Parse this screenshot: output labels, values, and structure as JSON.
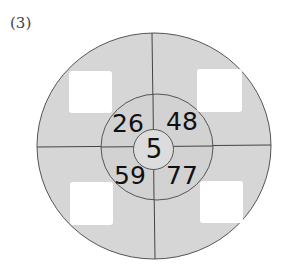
{
  "problem_label": "(3)",
  "diagram": {
    "center_number": "5",
    "inner_ring_numbers": {
      "top_left": "26",
      "top_right": "48",
      "bottom_left": "59",
      "bottom_right": "77"
    },
    "outer_ring_answer_boxes": {
      "top_left": "",
      "top_right": "",
      "bottom_left": "",
      "bottom_right": ""
    },
    "colors": {
      "fill": "#d6d6d6",
      "stroke": "#555555",
      "box": "#ffffff",
      "text": "#111111"
    }
  }
}
